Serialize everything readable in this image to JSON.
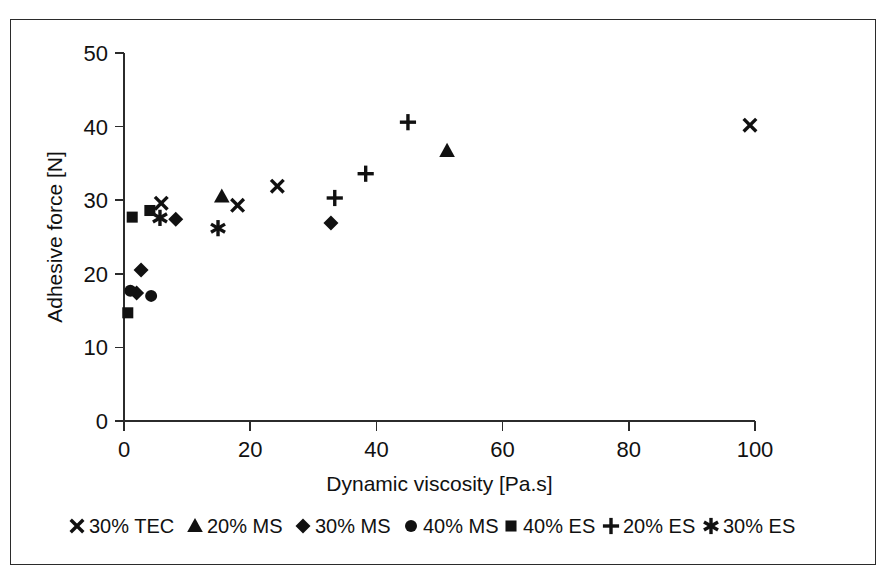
{
  "chart_data": {
    "type": "scatter",
    "title": "",
    "xlabel": "Dynamic viscosity [Pa.s]",
    "ylabel": "Adhesive force  [N]",
    "xlim": [
      0,
      100
    ],
    "ylim": [
      0,
      50
    ],
    "xticks": [
      "0",
      "20",
      "40",
      "60",
      "80",
      "100"
    ],
    "yticks": [
      "0",
      "10",
      "20",
      "30",
      "40",
      "50"
    ],
    "xtick_values": [
      0,
      20,
      40,
      60,
      80,
      100
    ],
    "ytick_values": [
      0,
      10,
      20,
      30,
      40,
      50
    ],
    "grid": false,
    "legend_position": "bottom",
    "series": [
      {
        "name": "30% TEC",
        "marker": "cross-x",
        "points": [
          [
            5.9,
            29.6
          ],
          [
            18.0,
            29.3
          ],
          [
            24.3,
            31.9
          ],
          [
            99.2,
            40.2
          ]
        ]
      },
      {
        "name": "20% MS",
        "marker": "triangle",
        "points": [
          [
            15.5,
            30.5
          ],
          [
            51.2,
            36.7
          ]
        ]
      },
      {
        "name": "30% MS",
        "marker": "diamond",
        "points": [
          [
            2.0,
            17.4
          ],
          [
            2.7,
            20.5
          ],
          [
            8.2,
            27.4
          ],
          [
            32.8,
            26.9
          ]
        ]
      },
      {
        "name": "40% MS",
        "marker": "circle",
        "points": [
          [
            1.0,
            17.7
          ],
          [
            4.3,
            17.0
          ]
        ]
      },
      {
        "name": "40% ES",
        "marker": "square",
        "points": [
          [
            0.6,
            14.7
          ],
          [
            1.3,
            27.7
          ],
          [
            4.1,
            28.6
          ]
        ]
      },
      {
        "name": "20% ES",
        "marker": "plus",
        "points": [
          [
            33.4,
            30.3
          ],
          [
            38.3,
            33.6
          ],
          [
            45.0,
            40.6
          ]
        ]
      },
      {
        "name": "30% ES",
        "marker": "asterisk",
        "points": [
          [
            5.7,
            27.6
          ],
          [
            14.9,
            26.2
          ]
        ]
      }
    ]
  },
  "legend": {
    "entries": [
      {
        "label": "30% TEC",
        "marker": "cross-x"
      },
      {
        "label": "20% MS",
        "marker": "triangle"
      },
      {
        "label": "30% MS",
        "marker": "diamond"
      },
      {
        "label": "40% MS",
        "marker": "circle"
      },
      {
        "label": "40% ES",
        "marker": "square"
      },
      {
        "label": "20% ES",
        "marker": "plus"
      },
      {
        "label": "30% ES",
        "marker": "asterisk"
      }
    ]
  },
  "colors": {
    "marker": "#111111",
    "axis": "#2b2b2b",
    "background": "#ffffff",
    "frame": "#2b2b2b"
  }
}
